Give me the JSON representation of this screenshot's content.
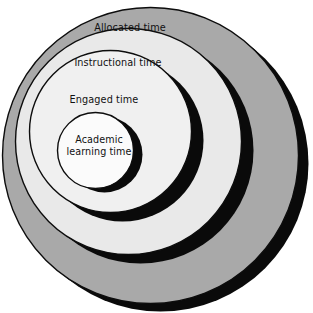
{
  "figure": {
    "background_color": "#ffffff",
    "width": 313,
    "height": 313
  },
  "palette": {
    "outer_ring_fill": "#a9a9a9",
    "second_ring_fill": "#e9e9e9",
    "third_ring_fill": "#f0f0f0",
    "inner_circle_fill": "#fbfbfb",
    "shadow": "#0a0a0a",
    "outline": "#0d0d0d",
    "text": "#111111"
  },
  "rings": [
    {
      "id": "allocated",
      "label": "Allocated time",
      "level": 1,
      "fill": "#a9a9a9",
      "shadow_fill": "#0a0a0a",
      "cx": 150.5,
      "cy": 155.5,
      "r": 148,
      "shadow_cx": 160.5,
      "shadow_cy": 163.5,
      "shadow_r": 148
    },
    {
      "id": "instructional",
      "label": "Instructional time",
      "level": 2,
      "fill": "#e9e9e9",
      "shadow_fill": "#0a0a0a",
      "cx": 128.5,
      "cy": 141.5,
      "r": 113,
      "shadow_cx": 140.5,
      "shadow_cy": 150.5,
      "shadow_r": 113
    },
    {
      "id": "engaged",
      "label": "Engaged time",
      "level": 3,
      "fill": "#f0f0f0",
      "shadow_fill": "#0a0a0a",
      "cx": 110.5,
      "cy": 131.5,
      "r": 81,
      "shadow_cx": 122.5,
      "shadow_cy": 140.5,
      "shadow_r": 81
    },
    {
      "id": "academic",
      "label": "Academic\nlearning time",
      "level": 4,
      "fill": "#fbfbfb",
      "shadow_fill": "#0a0a0a",
      "cx": 95.5,
      "cy": 150.5,
      "r": 38,
      "shadow_cx": 104.5,
      "shadow_cy": 154.5,
      "shadow_r": 38
    }
  ],
  "labels": {
    "allocated": "Allocated time",
    "instructional": "Instructional time",
    "engaged": "Engaged time",
    "academic": "Academic\nlearning time"
  }
}
